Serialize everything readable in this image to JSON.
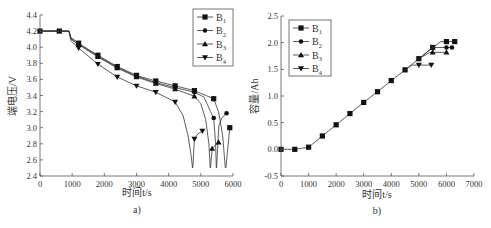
{
  "chart_data": [
    {
      "type": "line",
      "panel_label": "a)",
      "title": "",
      "xlabel": "时间t/s",
      "ylabel": "端电压/V",
      "xlim": [
        0,
        6000
      ],
      "ylim": [
        2.4,
        4.4
      ],
      "xticks": [
        0,
        1000,
        2000,
        3000,
        4000,
        5000,
        6000
      ],
      "yticks": [
        2.4,
        2.6,
        2.8,
        3.0,
        3.2,
        3.4,
        3.6,
        3.8,
        4.0,
        4.2,
        4.4
      ],
      "ytick_labels": [
        "2.4",
        "2.6",
        "2.8",
        "3.0",
        "3.2",
        "3.4",
        "3.6",
        "3.8",
        "4.0",
        "4.2",
        "4.4"
      ],
      "grid": false,
      "legend_position": "top-right",
      "series": [
        {
          "name": "B1",
          "sub": "1",
          "marker": "square",
          "line": [
            [
              0,
              4.2
            ],
            [
              600,
              4.2
            ],
            [
              900,
              4.2
            ],
            [
              960,
              4.12
            ],
            [
              1200,
              4.05
            ],
            [
              1800,
              3.9
            ],
            [
              2400,
              3.76
            ],
            [
              3000,
              3.65
            ],
            [
              3600,
              3.58
            ],
            [
              4200,
              3.52
            ],
            [
              4800,
              3.46
            ],
            [
              5400,
              3.36
            ],
            [
              5550,
              3.2
            ],
            [
              5680,
              2.9
            ],
            [
              5760,
              2.5
            ]
          ],
          "recovery": [
            [
              5780,
              2.5
            ],
            [
              5900,
              3.0
            ]
          ],
          "markers": [
            [
              0,
              4.2
            ],
            [
              600,
              4.2
            ],
            [
              1200,
              4.05
            ],
            [
              1800,
              3.9
            ],
            [
              2400,
              3.76
            ],
            [
              3000,
              3.65
            ],
            [
              3600,
              3.58
            ],
            [
              4200,
              3.52
            ],
            [
              4800,
              3.46
            ],
            [
              5400,
              3.36
            ],
            [
              5900,
              3.0
            ]
          ]
        },
        {
          "name": "B2",
          "sub": "2",
          "marker": "circle",
          "line": [
            [
              0,
              4.2
            ],
            [
              600,
              4.2
            ],
            [
              900,
              4.2
            ],
            [
              960,
              4.11
            ],
            [
              1200,
              4.04
            ],
            [
              1800,
              3.89
            ],
            [
              2400,
              3.75
            ],
            [
              3000,
              3.64
            ],
            [
              3600,
              3.56
            ],
            [
              4200,
              3.5
            ],
            [
              4800,
              3.44
            ],
            [
              5100,
              3.38
            ],
            [
              5300,
              3.2
            ],
            [
              5400,
              3.12
            ],
            [
              5460,
              2.8
            ],
            [
              5480,
              2.5
            ]
          ],
          "recovery": [
            [
              5490,
              2.5
            ],
            [
              5560,
              3.02
            ],
            [
              5650,
              3.12
            ],
            [
              5800,
              3.18
            ]
          ],
          "markers": [
            [
              1200,
              4.04
            ],
            [
              1800,
              3.89
            ],
            [
              2400,
              3.75
            ],
            [
              3000,
              3.64
            ],
            [
              3600,
              3.56
            ],
            [
              4200,
              3.5
            ],
            [
              4800,
              3.44
            ],
            [
              5400,
              3.12
            ],
            [
              5800,
              3.18
            ]
          ]
        },
        {
          "name": "B3",
          "sub": "3",
          "marker": "triangle-up",
          "line": [
            [
              0,
              4.2
            ],
            [
              600,
              4.2
            ],
            [
              900,
              4.2
            ],
            [
              960,
              4.1
            ],
            [
              1200,
              4.03
            ],
            [
              1800,
              3.88
            ],
            [
              2400,
              3.74
            ],
            [
              3000,
              3.63
            ],
            [
              3600,
              3.55
            ],
            [
              4200,
              3.48
            ],
            [
              4800,
              3.39
            ],
            [
              5000,
              3.3
            ],
            [
              5150,
              3.1
            ],
            [
              5250,
              2.8
            ],
            [
              5290,
              2.5
            ]
          ],
          "recovery": [
            [
              5300,
              2.5
            ],
            [
              5350,
              2.74
            ],
            [
              5450,
              2.78
            ],
            [
              5550,
              2.82
            ]
          ],
          "markers": [
            [
              1200,
              4.03
            ],
            [
              1800,
              3.88
            ],
            [
              2400,
              3.74
            ],
            [
              3000,
              3.63
            ],
            [
              3600,
              3.55
            ],
            [
              4200,
              3.48
            ],
            [
              4800,
              3.39
            ],
            [
              5350,
              2.74
            ],
            [
              5550,
              2.82
            ]
          ]
        },
        {
          "name": "B4",
          "sub": "4",
          "marker": "triangle-down",
          "line": [
            [
              0,
              4.2
            ],
            [
              600,
              4.2
            ],
            [
              900,
              4.2
            ],
            [
              960,
              4.08
            ],
            [
              1200,
              3.99
            ],
            [
              1800,
              3.79
            ],
            [
              2400,
              3.63
            ],
            [
              3000,
              3.52
            ],
            [
              3600,
              3.44
            ],
            [
              4200,
              3.32
            ],
            [
              4450,
              3.15
            ],
            [
              4600,
              2.9
            ],
            [
              4700,
              2.65
            ],
            [
              4740,
              2.5
            ]
          ],
          "recovery": [
            [
              4750,
              2.5
            ],
            [
              4800,
              2.86
            ],
            [
              4900,
              2.92
            ],
            [
              5050,
              2.96
            ]
          ],
          "markers": [
            [
              1200,
              3.99
            ],
            [
              1800,
              3.79
            ],
            [
              2400,
              3.63
            ],
            [
              3000,
              3.52
            ],
            [
              3600,
              3.44
            ],
            [
              4200,
              3.32
            ],
            [
              4800,
              2.86
            ],
            [
              5050,
              2.96
            ]
          ]
        }
      ]
    },
    {
      "type": "line",
      "panel_label": "b)",
      "title": "",
      "xlabel": "时间t/s",
      "ylabel": "容量/Ah",
      "xlim": [
        0,
        7000
      ],
      "ylim": [
        -0.5,
        2.5
      ],
      "xticks": [
        0,
        1000,
        2000,
        3000,
        4000,
        5000,
        6000,
        7000
      ],
      "yticks": [
        -0.5,
        0.0,
        0.5,
        1.0,
        1.5,
        2.0,
        2.5
      ],
      "ytick_labels": [
        "-0.5",
        "0.0",
        "0.5",
        "1.0",
        "1.5",
        "2.0",
        "2.5"
      ],
      "grid": false,
      "legend_position": "top-left",
      "series": [
        {
          "name": "B1",
          "sub": "1",
          "marker": "square",
          "line": [
            [
              0,
              0
            ],
            [
              500,
              0
            ],
            [
              1000,
              0.04
            ],
            [
              1500,
              0.25
            ],
            [
              2000,
              0.46
            ],
            [
              2500,
              0.67
            ],
            [
              3000,
              0.88
            ],
            [
              3500,
              1.08
            ],
            [
              4000,
              1.29
            ],
            [
              4500,
              1.49
            ],
            [
              5000,
              1.7
            ],
            [
              5500,
              1.91
            ],
            [
              5800,
              2.02
            ],
            [
              6300,
              2.02
            ]
          ],
          "markers": [
            [
              0,
              0
            ],
            [
              500,
              0
            ],
            [
              1000,
              0.04
            ],
            [
              1500,
              0.25
            ],
            [
              2000,
              0.46
            ],
            [
              2500,
              0.67
            ],
            [
              3000,
              0.88
            ],
            [
              3500,
              1.08
            ],
            [
              4000,
              1.29
            ],
            [
              4500,
              1.49
            ],
            [
              5000,
              1.7
            ],
            [
              5500,
              1.91
            ],
            [
              6000,
              2.02
            ],
            [
              6300,
              2.02
            ]
          ]
        },
        {
          "name": "B2",
          "sub": "2",
          "marker": "circle",
          "line": [
            [
              5000,
              1.7
            ],
            [
              5500,
              1.91
            ],
            [
              6200,
              1.91
            ]
          ],
          "markers": [
            [
              6000,
              1.91
            ],
            [
              6200,
              1.91
            ]
          ]
        },
        {
          "name": "B3",
          "sub": "3",
          "marker": "triangle-up",
          "line": [
            [
              5000,
              1.7
            ],
            [
              5400,
              1.82
            ],
            [
              6000,
              1.82
            ]
          ],
          "markers": [
            [
              5500,
              1.82
            ],
            [
              6000,
              1.82
            ]
          ]
        },
        {
          "name": "B4",
          "sub": "4",
          "marker": "triangle-down",
          "line": [
            [
              4500,
              1.49
            ],
            [
              4750,
              1.58
            ],
            [
              5450,
              1.58
            ]
          ],
          "markers": [
            [
              5000,
              1.58
            ],
            [
              5450,
              1.58
            ]
          ]
        }
      ]
    }
  ]
}
